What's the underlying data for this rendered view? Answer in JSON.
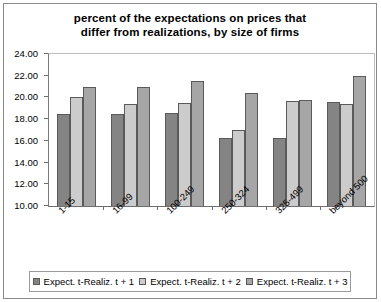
{
  "chart_data": {
    "type": "bar",
    "title": "percent of the expectations on prices that differ from realizations, by size of firms",
    "title_line1": "percent of the expectations on prices that",
    "title_line2": "differ from realizations, by size of firms",
    "xlabel": "",
    "ylabel": "",
    "ylim": [
      10.0,
      24.0
    ],
    "ytick_step": 2.0,
    "grid": false,
    "legend_position": "bottom",
    "categories": [
      "1-15",
      "16-99",
      "100-249",
      "250-324",
      "325-499",
      "beyond 500"
    ],
    "ytick_labels": [
      "24.00",
      "22.00",
      "20.00",
      "18.00",
      "16.00",
      "14.00",
      "12.00",
      "10.00"
    ],
    "ytick_values": [
      24.0,
      22.0,
      20.0,
      18.0,
      16.0,
      14.0,
      12.0,
      10.0
    ],
    "series": [
      {
        "name": "Expect. t-Realiz. t + 1",
        "color": "#848484",
        "values": [
          18.5,
          18.5,
          18.6,
          16.3,
          16.3,
          19.6
        ]
      },
      {
        "name": "Expect. t-Realiz. t + 2",
        "color": "#cccccc",
        "values": [
          20.0,
          19.4,
          19.5,
          17.0,
          19.7,
          19.4
        ]
      },
      {
        "name": "Expect. t-Realiz. t + 3",
        "color": "#a6a6a6",
        "values": [
          21.0,
          21.0,
          21.5,
          20.4,
          19.8,
          22.0
        ]
      }
    ]
  }
}
